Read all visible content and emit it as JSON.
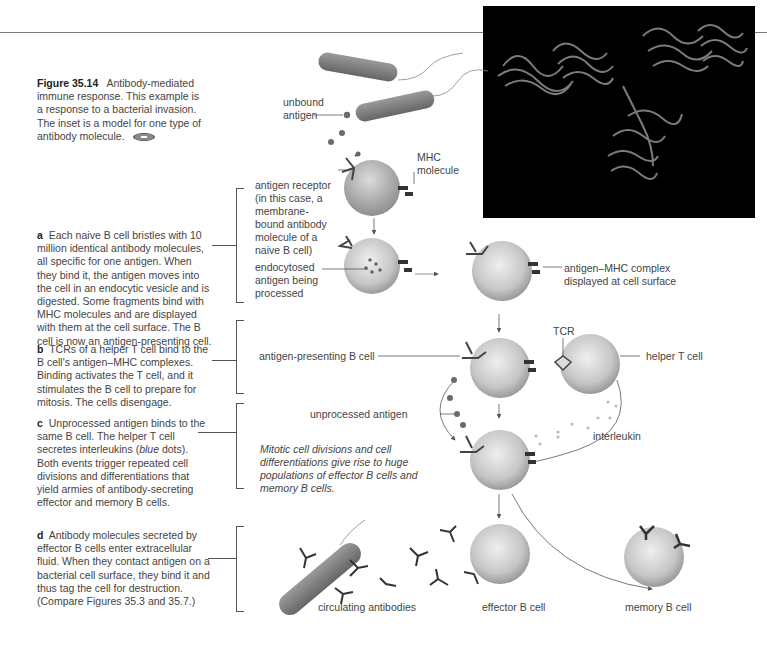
{
  "figure": {
    "number": "Figure 35.14",
    "title": "Antibody-mediated immune response.",
    "caption_rest": "This example is a response to a bacterial invasion. The inset is a model for one type of antibody molecule."
  },
  "steps": [
    {
      "letter": "a",
      "text": "Each naive B cell bristles with 10 million identical antibody molecules, all specific for one antigen. When they bind it, the antigen moves into the cell in an endocytic vesicle and is digested. Some fragments bind with MHC molecules and are displayed with them at the cell surface. The B cell is now an antigen-presenting cell."
    },
    {
      "letter": "b",
      "text": "TCRs of a helper T cell bind to the B cell's antigen–MHC complexes. Binding activates the T cell, and it stimulates the B cell to prepare for mitosis. The cells disengage."
    },
    {
      "letter": "c",
      "text_before": "Unprocessed antigen binds to the same B cell. The helper T cell secretes interleukins (",
      "text_italic": "blue",
      "text_after": " dots). Both events trigger repeated cell divisions and differentiations that yield armies of antibody-secreting effector and memory B cells."
    },
    {
      "letter": "d",
      "text": "Antibody molecules secreted by effector B cells enter extracellular fluid. When they contact antigen on a bacterial cell surface, they bind it and thus tag the cell for destruction. (Compare Figures 35.3 and 35.7.)"
    }
  ],
  "labels": {
    "unbound_antigen": "unbound antigen",
    "mhc_molecule": "MHC molecule",
    "antigen_receptor": "antigen receptor (in this case, a membrane-bound antibody molecule of a naive B cell)",
    "endocytosed": "endocytosed antigen being processed",
    "antigen_mhc_complex": "antigen–MHC complex displayed at cell surface",
    "tcr": "TCR",
    "antigen_presenting": "antigen-presenting B cell",
    "helper_t": "helper T cell",
    "unprocessed": "unprocessed antigen",
    "interleukin": "interleukin",
    "mitotic_note": "Mitotic cell divisions and cell differentiations give rise to huge populations of effector B cells and memory B cells.",
    "circulating": "circulating antibodies",
    "effector": "effector B cell",
    "memory": "memory B cell"
  },
  "colors": {
    "text": "#444444",
    "bracket": "#555555",
    "inset_bg": "#000000",
    "cell_fill": "#c9c9c9",
    "bacterium": "#7d7d7d"
  }
}
